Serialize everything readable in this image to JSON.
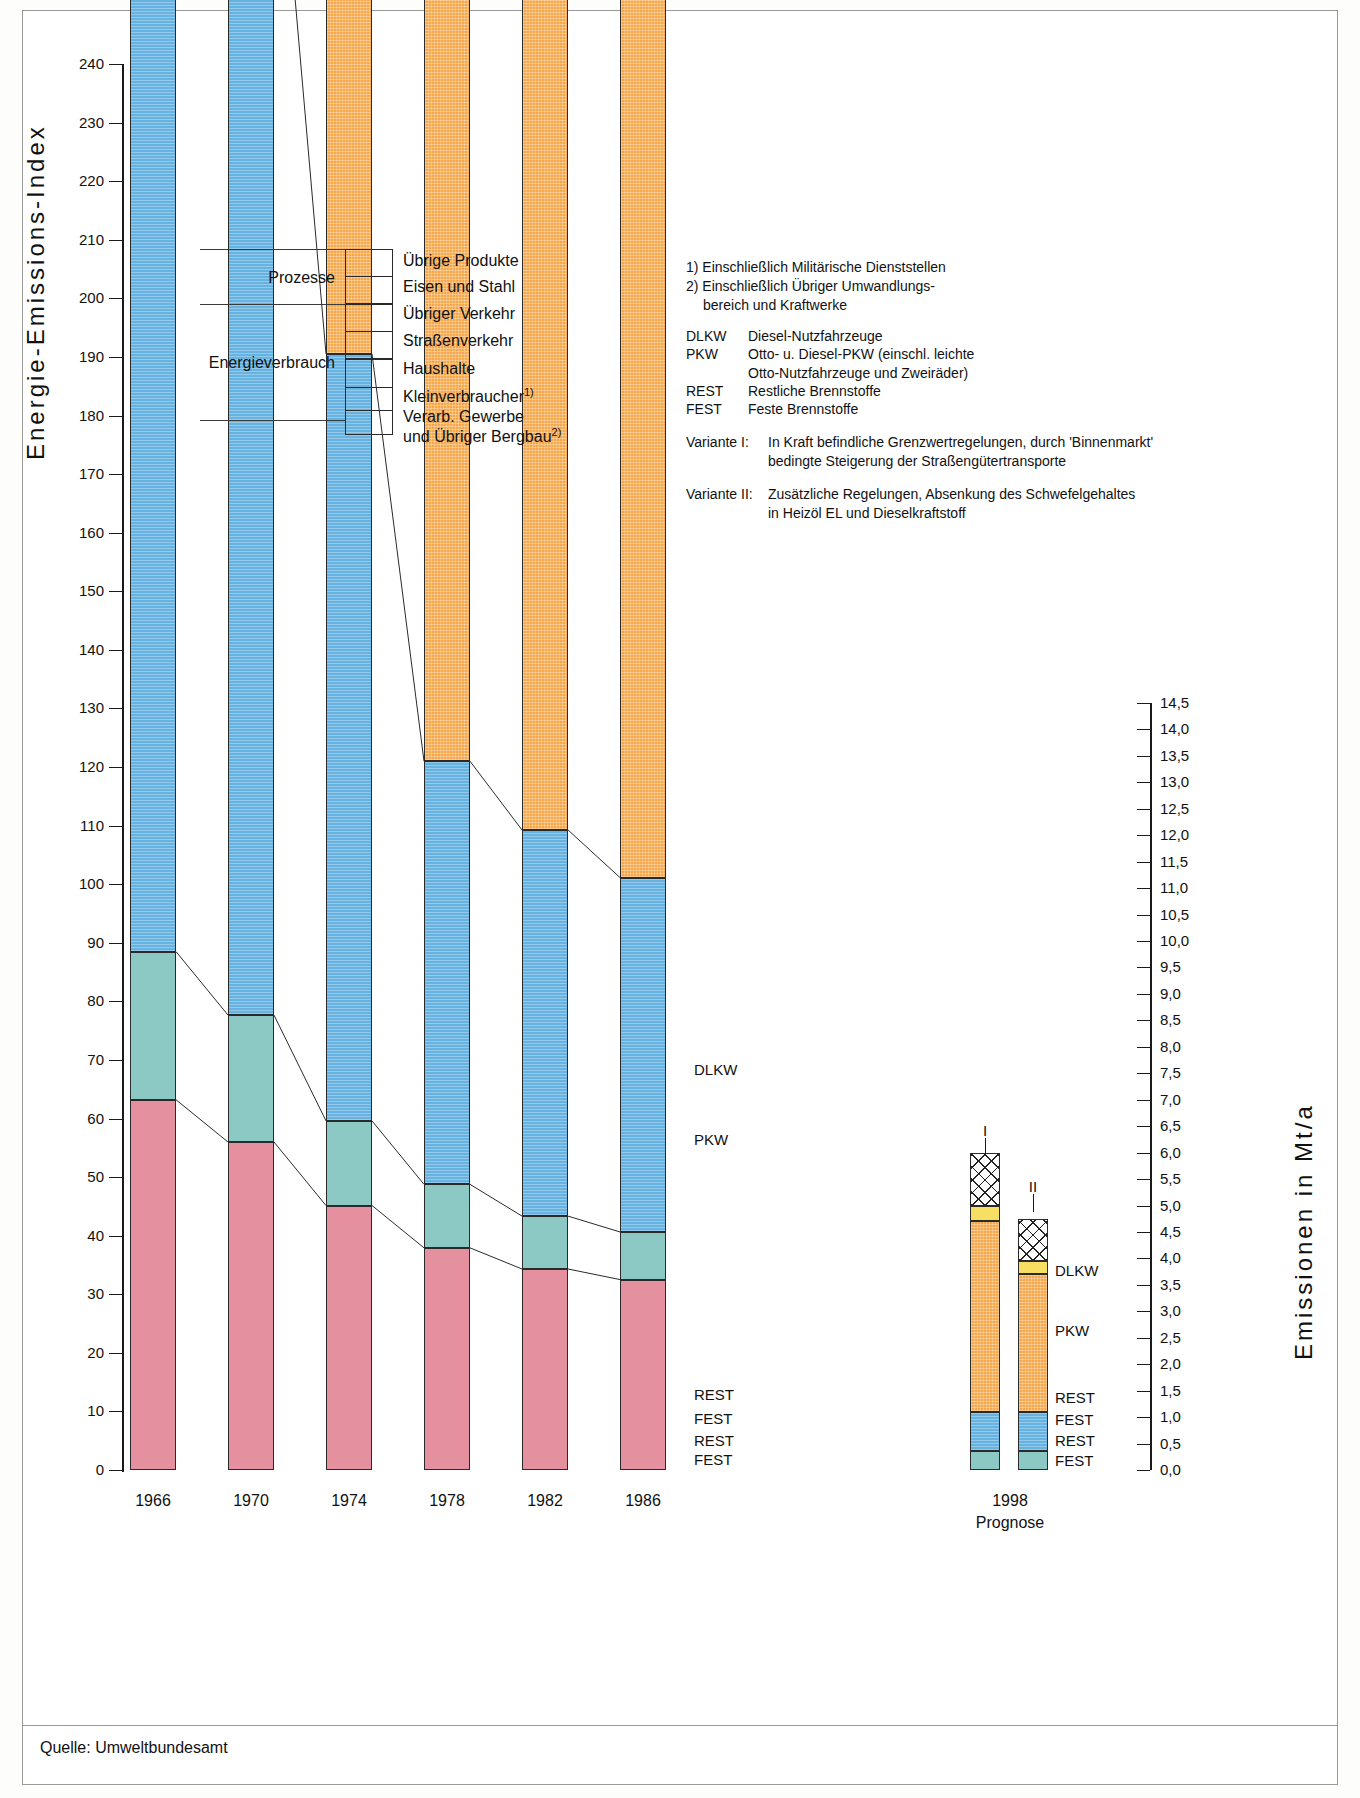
{
  "axes": {
    "left_title": "Energie-Emissions-Index",
    "right_title": "Emissionen in Mt/a",
    "left_ticks": [
      "240",
      "230",
      "220",
      "210",
      "200",
      "190",
      "180",
      "170",
      "160",
      "150",
      "140",
      "130",
      "120",
      "110",
      "100",
      "90",
      "80",
      "70",
      "60",
      "50",
      "40",
      "30",
      "20",
      "10",
      "0"
    ],
    "right_ticks": [
      "14,5",
      "14,0",
      "13,5",
      "13,0",
      "12,5",
      "12,0",
      "11,5",
      "11,0",
      "10,5",
      "10,0",
      "9,5",
      "9,0",
      "8,5",
      "8,0",
      "7,5",
      "7,0",
      "6,5",
      "6,0",
      "5,5",
      "5,0",
      "4,5",
      "4,0",
      "3,5",
      "3,0",
      "2,5",
      "2,0",
      "1,5",
      "1,0",
      "0,5",
      "0,0"
    ],
    "left_min": 0,
    "left_max": 240,
    "right_min": 0.0,
    "right_max": 14.5
  },
  "legend": {
    "groups": [
      {
        "label": "Prozesse"
      },
      {
        "label": "Energieverbrauch"
      }
    ],
    "items": [
      {
        "label": "Übrige Produkte",
        "pattern": "hatch",
        "color": "#ffffff"
      },
      {
        "label": "Eisen und Stahl",
        "pattern": "hatch",
        "color": "#ffffff"
      },
      {
        "label": "Übriger Verkehr",
        "pattern": "solid",
        "color": "#f7df63"
      },
      {
        "label": "Straßenverkehr",
        "pattern": "solid",
        "color": "#f6a74a"
      },
      {
        "label": "Haushalte",
        "pattern": "solid",
        "color": "#66b2e0"
      },
      {
        "label": "Kleinverbraucher",
        "footnote": "1)",
        "pattern": "solid",
        "color": "#8cc9c4"
      },
      {
        "label": "Verarb. Gewerbe",
        "label2": "und Übriger Bergbau",
        "footnote": "2)",
        "pattern": "solid",
        "color": "#e4909e"
      }
    ]
  },
  "notes": {
    "footnote1": "1) Einschließlich Militärische Dienststellen",
    "footnote2": "2) Einschließlich Übriger Umwandlungs-",
    "footnote2_cont": "bereich und Kraftwerke",
    "abbreviations": [
      {
        "key": "DLKW",
        "value": "Diesel-Nutzfahrzeuge"
      },
      {
        "key": "PKW",
        "value": "Otto- u. Diesel-PKW (einschl. leichte"
      },
      {
        "key": "",
        "value": "Otto-Nutzfahrzeuge und Zweiräder)"
      },
      {
        "key": "REST",
        "value": "Restliche Brennstoffe"
      },
      {
        "key": "FEST",
        "value": "Feste Brennstoffe"
      }
    ],
    "variants": [
      {
        "key": "Variante I:",
        "value": "In Kraft befindliche Grenzwertregelungen, durch 'Binnenmarkt'",
        "cont": "bedingte Steigerung der Straßengütertransporte"
      },
      {
        "key": "Variante II:",
        "value": "Zusätzliche Regelungen, Absenkung des Schwefelgehaltes",
        "cont": "in Heizöl EL und Dieselkraftstoff"
      }
    ]
  },
  "series_labels": {
    "main": [
      {
        "text": "DLKW"
      },
      {
        "text": "PKW"
      },
      {
        "text": "REST"
      },
      {
        "text": "FEST"
      },
      {
        "text": "REST"
      },
      {
        "text": "FEST"
      }
    ],
    "forecast": [
      {
        "text": "DLKW"
      },
      {
        "text": "PKW"
      },
      {
        "text": "REST"
      },
      {
        "text": "FEST"
      },
      {
        "text": "REST"
      },
      {
        "text": "FEST"
      }
    ]
  },
  "variant_marks": [
    {
      "text": "I"
    },
    {
      "text": "II"
    }
  ],
  "forecast_caption": {
    "year": "1998",
    "sub": "Prognose"
  },
  "source": "Quelle: Umweltbundesamt",
  "chart_data": {
    "type": "bar",
    "title": "Energie-Emissions-Index",
    "xlabel": "",
    "ylabel": "Energie-Emissions-Index",
    "ylabel_right": "Emissionen in Mt/a",
    "ylim": [
      0,
      240
    ],
    "ylim_right": [
      0.0,
      14.5
    ],
    "grid": false,
    "legend_position": "upper-left",
    "categories": [
      "1966",
      "1970",
      "1974",
      "1978",
      "1982",
      "1986",
      "1998 I",
      "1998 II"
    ],
    "stack_order": [
      "Verarb. Gewerbe und Übriger Bergbau",
      "Kleinverbraucher",
      "Haushalte",
      "Straßenverkehr",
      "Übriger Verkehr",
      "Eisen und Stahl / Übrige Produkte"
    ],
    "series": [
      {
        "name": "Verarb. Gewerbe und Übriger Bergbau",
        "color": "#e4909e",
        "values": [
          7.0,
          6.2,
          5.0,
          4.2,
          3.8,
          3.6,
          0.0,
          0.0
        ]
      },
      {
        "name": "Kleinverbraucher",
        "color": "#8cc9c4",
        "values": [
          2.8,
          2.4,
          1.6,
          1.2,
          1.0,
          0.9,
          0.35,
          0.35
        ]
      },
      {
        "name": "Haushalte",
        "color": "#66b2e0",
        "values": [
          29.5,
          23.8,
          14.5,
          8.0,
          7.3,
          6.7,
          0.75,
          0.75
        ]
      },
      {
        "name": "Straßenverkehr",
        "color": "#f6a74a",
        "values": [
          56.5,
          75.0,
          81.0,
          82.5,
          62.0,
          56.0,
          3.6,
          2.6
        ]
      },
      {
        "name": "Übriger Verkehr",
        "color": "#f7df63",
        "values": [
          4.5,
          4.5,
          4.5,
          4.0,
          3.5,
          3.5,
          0.3,
          0.25
        ]
      },
      {
        "name": "Eisen und Stahl / Übrige Produkte",
        "color": "#ffffff",
        "pattern": "hatch",
        "values": [
          10.7,
          13.6,
          15.9,
          11.2,
          9.6,
          9.3,
          1.0,
          0.8
        ]
      }
    ],
    "totals_index": [
      111.0,
      125.5,
      122.5,
      111.1,
      87.2,
      80.0,
      null,
      null
    ],
    "totals_mt": [
      6.7,
      7.6,
      7.4,
      6.7,
      5.3,
      4.8,
      6.0,
      4.9
    ]
  }
}
